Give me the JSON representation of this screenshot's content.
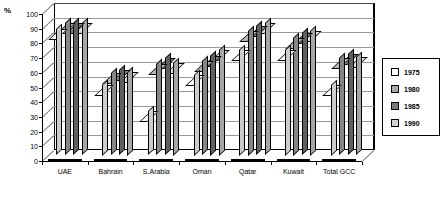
{
  "chart_data": {
    "type": "bar",
    "title": "",
    "subtitle": "",
    "xlabel": "",
    "ylabel": "%",
    "ylim": [
      0,
      100
    ],
    "ytick_values": [
      0,
      10,
      20,
      30,
      40,
      50,
      60,
      70,
      80,
      90,
      100
    ],
    "ytick_labels": [
      "0",
      "10",
      "20",
      "30",
      "40",
      "50",
      "60",
      "70",
      "80",
      "90",
      "100"
    ],
    "grid": true,
    "grid_axis": "y",
    "legend_position": "right",
    "categories": [
      "UAE",
      "Bahrain",
      "S.Arabia",
      "Oman",
      "Qatar",
      "Kuwait",
      "Total GCC"
    ],
    "series": [
      {
        "name": "1975",
        "color": "#ffffff",
        "values": [
          86,
          48,
          30,
          55,
          72,
          72,
          48
        ]
      },
      {
        "name": "1980",
        "color": "#a8a8a8",
        "values": [
          90,
          56,
          62,
          64,
          85,
          80,
          66
        ]
      },
      {
        "name": "1985",
        "color": "#787878",
        "values": [
          90,
          58,
          66,
          68,
          88,
          83,
          69
        ]
      },
      {
        "name": "1990",
        "color": "#d0d0d0",
        "values": [
          90,
          57,
          63,
          72,
          90,
          85,
          67
        ]
      }
    ]
  },
  "legend": {
    "entries": [
      {
        "label": "1975"
      },
      {
        "label": "1980"
      },
      {
        "label": "1985"
      },
      {
        "label": "1990"
      }
    ]
  },
  "axis": {
    "unit_label": "%"
  }
}
